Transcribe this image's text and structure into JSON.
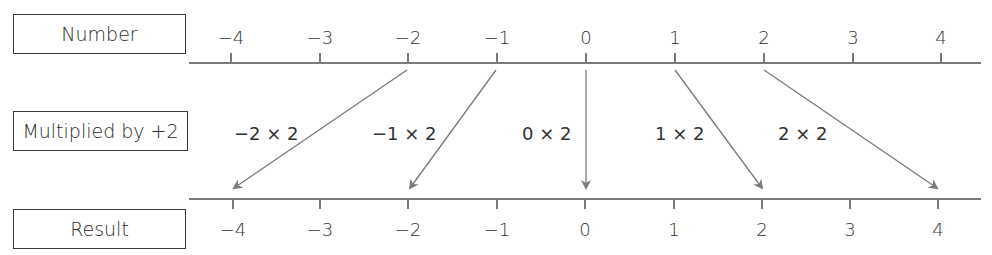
{
  "rows": {
    "number_label": "Number",
    "multiplier_label": "Multiplied by +2",
    "result_label": "Result"
  },
  "number_line_top": {
    "ticks": [
      "−4",
      "−3",
      "−2",
      "−1",
      "0",
      "1",
      "2",
      "3",
      "4"
    ]
  },
  "number_line_bottom": {
    "ticks": [
      "−4",
      "−3",
      "−2",
      "−1",
      "0",
      "1",
      "2",
      "3",
      "4"
    ]
  },
  "mappings": [
    {
      "from": "−2",
      "expression": "−2 × 2",
      "to": "−4"
    },
    {
      "from": "−1",
      "expression": "−1 × 2",
      "to": "−2"
    },
    {
      "from": "0",
      "expression": "0 × 2",
      "to": "0"
    },
    {
      "from": "1",
      "expression": "1 × 2",
      "to": "2"
    },
    {
      "from": "2",
      "expression": "2 × 2",
      "to": "4"
    }
  ],
  "colors": {
    "line": "#7a7a7a",
    "text": "#333333",
    "box_border": "#3a3a3a"
  }
}
